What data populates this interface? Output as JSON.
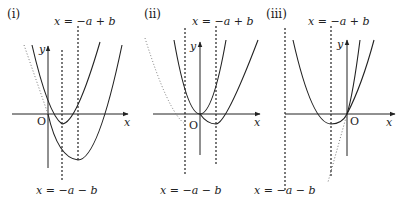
{
  "panels": [
    {
      "id": "i",
      "label": "(i)",
      "top_line_label": "x = −a + b",
      "bottom_line_label": "x = −a − b",
      "axis_x": "x",
      "axis_y": "y",
      "origin": "O"
    },
    {
      "id": "ii",
      "label": "(ii)",
      "top_line_label": "x = −a + b",
      "bottom_line_label": "x = −a − b",
      "axis_x": "x",
      "axis_y": "y",
      "origin": "O"
    },
    {
      "id": "iii",
      "label": "(iii)",
      "top_line_label": "x = −a + b",
      "bottom_line_label": "x = −a − b",
      "axis_x": "x",
      "axis_y": "y",
      "origin": "O"
    }
  ],
  "colors": {
    "stroke": "#222222",
    "dotted": "#777777"
  }
}
